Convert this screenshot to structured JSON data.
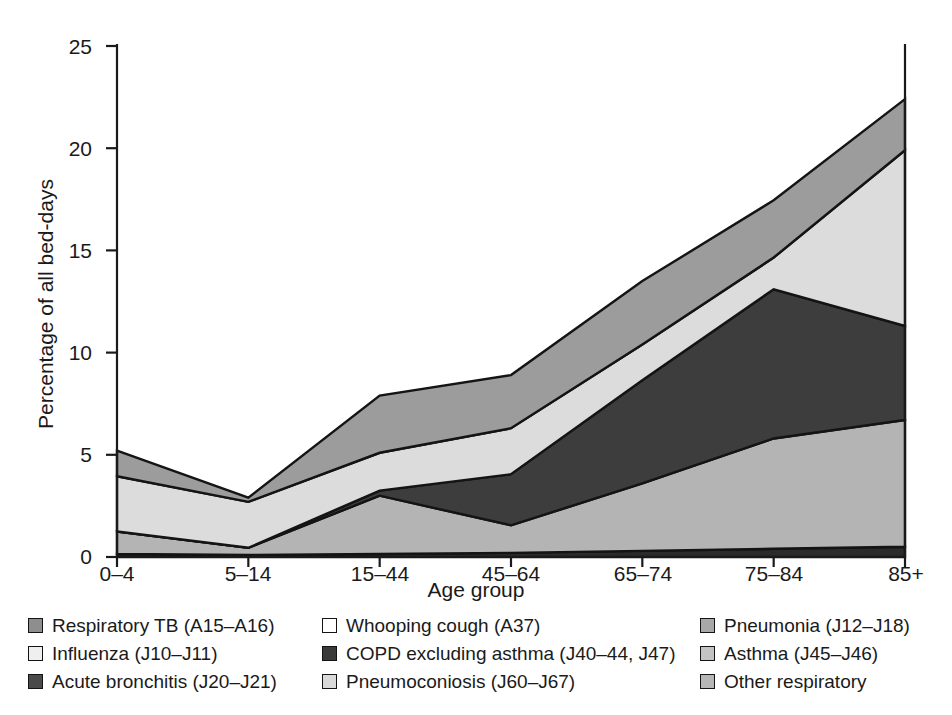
{
  "chart_data": {
    "type": "area",
    "stacked": true,
    "title": "",
    "subtitle": "",
    "xlabel": "Age group",
    "ylabel": "Percentage of all bed-days",
    "categories": [
      "0–4",
      "5–14",
      "15–44",
      "45–64",
      "65–74",
      "75–84",
      "85+"
    ],
    "ylim": [
      0,
      25
    ],
    "yticks": [
      0,
      5,
      10,
      15,
      20,
      25
    ],
    "ytick_labels": [
      "0",
      "5",
      "10",
      "15",
      "20",
      "25"
    ],
    "grid": false,
    "legend_position": "below",
    "stack_order_bottom_to_top": [
      "Whooping cough (A37)",
      "COPD excluding asthma (J40–44, J47)",
      "Pneumoconiosis (J60–67)",
      "Pneumonia (J12–J18)",
      "Asthma (J45–J46)",
      "Other respiratory",
      "Acute bronchitis (J20–J21)",
      "Influenza (J10–J11)",
      "Respiratory TB (A15–A16)"
    ],
    "series": [
      {
        "name": "Other respiratory",
        "key": "other_resp",
        "color": "#b6b6b6",
        "values": [
          0.15,
          0.1,
          0.15,
          0.2,
          0.3,
          0.4,
          0.5
        ]
      },
      {
        "name": "Acute bronchitis (J20–J21)",
        "key": "bronchitis",
        "color": "#4a4a4a",
        "values": [
          0.0,
          0.0,
          0.0,
          0.0,
          0.0,
          0.0,
          0.0
        ]
      },
      {
        "name": "Asthma (J45–J46)",
        "key": "asthma",
        "color": "#c3c3c3",
        "values": [
          1.1,
          0.35,
          2.85,
          1.35,
          3.3,
          5.4,
          6.2
        ]
      },
      {
        "name": "COPD excluding asthma (J40–44, J47)",
        "key": "copd",
        "color": "#3a3a3a",
        "values": [
          0.0,
          0.0,
          0.25,
          2.5,
          5.05,
          7.3,
          4.6
        ]
      },
      {
        "name": "Pneumoconiosis (J60–67)",
        "key": "pneumoconiosis",
        "color": "#d9d9d9",
        "values": [
          2.7,
          2.25,
          1.85,
          2.25,
          1.75,
          1.55,
          8.6
        ]
      },
      {
        "name": "Pneumonia (J12–J18)",
        "key": "pneumonia",
        "color": "#a8a8a8",
        "values": [
          1.25,
          0.2,
          2.8,
          2.6,
          3.1,
          2.8,
          2.5
        ]
      },
      {
        "name": "Influenza (J10–J11)",
        "key": "influenza",
        "color": "#efefef",
        "values": [
          0.0,
          0.0,
          0.0,
          0.0,
          0.0,
          0.0,
          0.0
        ]
      },
      {
        "name": "Respiratory TB (A15–A16)",
        "key": "resp_tb",
        "color": "#8e8e8e",
        "values": [
          0.0,
          0.0,
          0.0,
          0.0,
          0.0,
          0.0,
          0.0
        ]
      },
      {
        "name": "Whooping cough (A37)",
        "key": "whooping",
        "color": "#ffffff",
        "values": [
          0.0,
          0.0,
          0.0,
          0.0,
          0.0,
          0.0,
          0.0
        ]
      }
    ],
    "cumulative_boundaries": {
      "note": "Upper boundary of each drawn band, percentage of all bed-days, by age group.",
      "band1_top": [
        0.15,
        0.1,
        0.15,
        0.2,
        0.3,
        0.4,
        0.5
      ],
      "band2_top": [
        1.25,
        0.45,
        3.0,
        1.55,
        3.6,
        5.8,
        6.7
      ],
      "band3_top": [
        1.25,
        0.45,
        3.25,
        4.05,
        8.65,
        13.1,
        11.3
      ],
      "band4_top": [
        3.95,
        2.7,
        5.1,
        6.3,
        10.4,
        14.65,
        19.9
      ],
      "band5_top": [
        5.2,
        2.9,
        7.9,
        8.9,
        13.5,
        17.45,
        22.4
      ]
    },
    "total_top_values": [
      5.2,
      2.9,
      7.9,
      8.9,
      13.5,
      17.45,
      22.4
    ]
  },
  "axes": {
    "y": {
      "label": "Percentage of all bed-days",
      "ticks": [
        {
          "value": 25,
          "label": "25"
        },
        {
          "value": 20,
          "label": "20"
        },
        {
          "value": 15,
          "label": "15"
        },
        {
          "value": 10,
          "label": "10"
        },
        {
          "value": 5,
          "label": "5"
        },
        {
          "value": 0,
          "label": "0"
        }
      ]
    },
    "x": {
      "label": "Age group",
      "ticks": [
        {
          "label": "0–4"
        },
        {
          "label": "5–14"
        },
        {
          "label": "15–44"
        },
        {
          "label": "45–64"
        },
        {
          "label": "65–74"
        },
        {
          "label": "75–84"
        },
        {
          "label": "85+"
        }
      ]
    }
  },
  "legend": {
    "columns": [
      {
        "items": [
          {
            "label": "Respiratory TB (A15–A16)",
            "color": "#8e8e8e"
          },
          {
            "label": "Influenza (J10–J11)",
            "color": "#efefef"
          },
          {
            "label": "Acute bronchitis (J20–J21)",
            "color": "#4a4a4a"
          }
        ]
      },
      {
        "items": [
          {
            "label": "Whooping cough (A37)",
            "color": "#ffffff"
          },
          {
            "label": "COPD excluding asthma (J40–44, J47)",
            "color": "#3a3a3a"
          },
          {
            "label": "Pneumoconiosis (J60–J67)",
            "color": "#d9d9d9"
          }
        ]
      },
      {
        "items": [
          {
            "label": "Pneumonia (J12–J18)",
            "color": "#a8a8a8"
          },
          {
            "label": "Asthma (J45–J46)",
            "color": "#c3c3c3"
          },
          {
            "label": "Other respiratory",
            "color": "#b6b6b6"
          }
        ]
      }
    ]
  },
  "colors": {
    "axis": "#1a1a1a",
    "text": "#1a1a1a",
    "background": "#ffffff",
    "band_outline": "#141414"
  }
}
